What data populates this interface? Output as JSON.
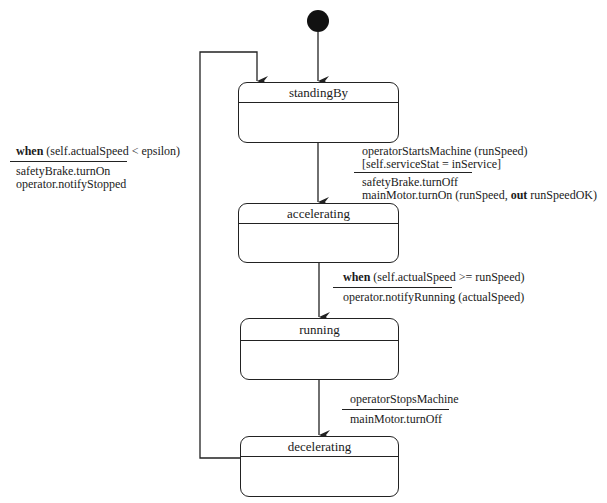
{
  "diagram": {
    "type": "UML state machine",
    "initial_state": {
      "cx": 318,
      "cy": 21,
      "r": 11
    },
    "states": [
      {
        "id": "standingBy",
        "name": "standingBy",
        "x": 238,
        "y": 82,
        "w": 161,
        "h": 61,
        "header_h": 19
      },
      {
        "id": "accelerating",
        "name": "accelerating",
        "x": 238,
        "y": 203,
        "w": 161,
        "h": 60,
        "header_h": 19
      },
      {
        "id": "running",
        "name": "running",
        "x": 240,
        "y": 318,
        "w": 159,
        "h": 62,
        "header_h": 21
      },
      {
        "id": "decelerating",
        "name": "decelerating",
        "x": 240,
        "y": 436,
        "w": 159,
        "h": 61,
        "header_h": 19
      }
    ],
    "transitions": [
      {
        "from": "initial",
        "to": "standingBy",
        "trigger_keyword": "",
        "trigger": "",
        "guard": "",
        "actions": []
      },
      {
        "from": "standingBy",
        "to": "accelerating",
        "trigger_keyword": "",
        "trigger": "operatorStartsMachine (runSpeed)",
        "guard": "[self.serviceStat = inService]",
        "actions": [
          "safetyBrake.turnOff",
          "mainMotor.turnOn (runSpeed, ",
          "out",
          " runSpeedOK)"
        ]
      },
      {
        "from": "accelerating",
        "to": "running",
        "trigger_keyword": "when",
        "trigger": " (self.actualSpeed >= runSpeed)",
        "guard": "",
        "actions": [
          "operator.notifyRunning (actualSpeed)"
        ]
      },
      {
        "from": "running",
        "to": "decelerating",
        "trigger_keyword": "",
        "trigger": "operatorStopsMachine",
        "guard": "",
        "actions": [
          "mainMotor.turnOff"
        ]
      },
      {
        "from": "decelerating",
        "to": "standingBy",
        "trigger_keyword": "when",
        "trigger": " (self.actualSpeed < epsilon)",
        "guard": "",
        "actions": [
          "safetyBrake.turnOn",
          "operator.notifyStopped"
        ]
      }
    ],
    "colors": {
      "line": "#222222",
      "background": "#ffffff",
      "text": "#1a1a1a"
    }
  }
}
